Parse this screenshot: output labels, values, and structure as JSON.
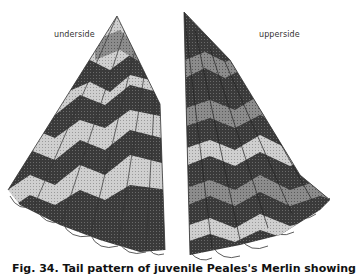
{
  "figure": {
    "labels": {
      "left": "underside",
      "right": "upperside"
    },
    "caption": "Fig. 34. Tail pattern of juvenile Peales's Merlin showing",
    "colors": {
      "dark_band": "#3c3c3c",
      "light_band": "#c8c8c8",
      "mid_band": "#8a8a8a",
      "outline": "#222222",
      "background": "#ffffff"
    },
    "panels": [
      {
        "name": "underside",
        "side": "left",
        "feathers": 6
      },
      {
        "name": "upperside",
        "side": "right",
        "feathers": 6
      }
    ]
  }
}
